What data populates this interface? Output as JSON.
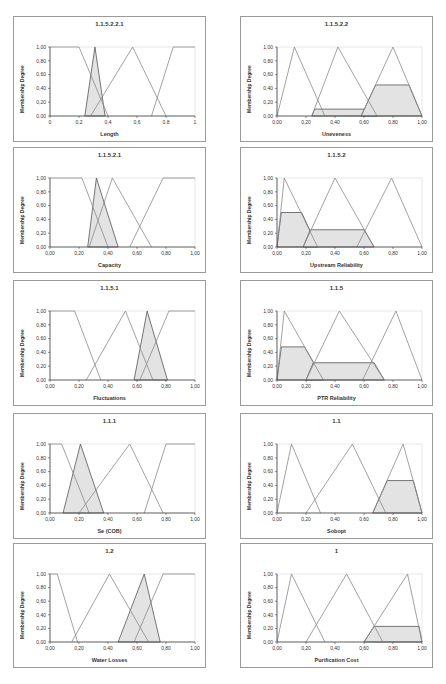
{
  "page": {
    "ylabel": "Membership Degree"
  },
  "chart_data": [
    {
      "type": "line",
      "title": "1.1.5.2.2.1",
      "xlabel": "Length",
      "ylabel": "Membership Degree",
      "xticks": [
        "0",
        "0,2",
        "0,4",
        "0,6",
        "0,8",
        "1"
      ],
      "yticks": [
        "0,00",
        "0,20",
        "0,40",
        "0,60",
        "0,80",
        "1,00"
      ],
      "xlim": [
        0,
        1
      ],
      "ylim": [
        0,
        1
      ],
      "series": [
        {
          "name": "MF1",
          "x": [
            0,
            0.2,
            0.4
          ],
          "y": [
            1,
            1,
            0
          ]
        },
        {
          "name": "MF2",
          "x": [
            0.28,
            0.57,
            0.8
          ],
          "y": [
            0,
            1,
            0
          ]
        },
        {
          "name": "MF3",
          "x": [
            0.7,
            0.85,
            1
          ],
          "y": [
            0,
            1,
            1
          ]
        },
        {
          "name": "Input",
          "x": [
            0.24,
            0.31,
            0.38
          ],
          "y": [
            0,
            1,
            0
          ],
          "shaded": true
        }
      ]
    },
    {
      "type": "line",
      "title": "1.1.5.2.2",
      "xlabel": "Uneveness",
      "ylabel": "Membership Degree",
      "xticks": [
        "0,00",
        "0,20",
        "0,40",
        "0,60",
        "0,80",
        "1,00"
      ],
      "yticks": [
        "0,00",
        "0,20",
        "0,40",
        "0,60",
        "0,80",
        "1,00"
      ],
      "xlim": [
        0,
        1
      ],
      "ylim": [
        0,
        1
      ],
      "series": [
        {
          "name": "MF1",
          "x": [
            0,
            0.12,
            0.33
          ],
          "y": [
            0,
            1,
            0
          ]
        },
        {
          "name": "MF2",
          "x": [
            0.24,
            0.42,
            0.69
          ],
          "y": [
            0,
            1,
            0
          ]
        },
        {
          "name": "MF3",
          "x": [
            0.58,
            0.8,
            1
          ],
          "y": [
            0,
            1,
            0
          ]
        },
        {
          "name": "Clipped1",
          "x": [
            0.24,
            0.26,
            0.66,
            0.69
          ],
          "y": [
            0,
            0.1,
            0.1,
            0
          ],
          "shaded": true
        },
        {
          "name": "Clipped2",
          "x": [
            0.58,
            0.68,
            0.91,
            1
          ],
          "y": [
            0,
            0.45,
            0.45,
            0
          ],
          "shaded": true
        }
      ]
    },
    {
      "type": "line",
      "title": "1.1.5.2.1",
      "xlabel": "Capacity",
      "ylabel": "Membership Degree",
      "xticks": [
        "0,00",
        "0,20",
        "0,40",
        "0,60",
        "0,80",
        "1,00"
      ],
      "yticks": [
        "0,00",
        "0,20",
        "0,40",
        "0,60",
        "0,80",
        "1,00"
      ],
      "xlim": [
        0,
        1
      ],
      "ylim": [
        0,
        1
      ],
      "series": [
        {
          "name": "MF1",
          "x": [
            0,
            0.22,
            0.4
          ],
          "y": [
            1,
            1,
            0
          ]
        },
        {
          "name": "MF2",
          "x": [
            0.27,
            0.43,
            0.7
          ],
          "y": [
            0,
            1,
            0
          ]
        },
        {
          "name": "MF3",
          "x": [
            0.55,
            0.78,
            1
          ],
          "y": [
            0,
            1,
            1
          ]
        },
        {
          "name": "Input",
          "x": [
            0.26,
            0.32,
            0.47
          ],
          "y": [
            0,
            1,
            0
          ],
          "shaded": true
        }
      ]
    },
    {
      "type": "line",
      "title": "1.1.5.2",
      "xlabel": "Upstream Reliability",
      "ylabel": "Membership Degree",
      "xticks": [
        "0,00",
        "0,20",
        "0,40",
        "0,60",
        "0,80",
        "1,00"
      ],
      "yticks": [
        "0,00",
        "0,20",
        "0,40",
        "0,60",
        "0,80",
        "1,00"
      ],
      "xlim": [
        0,
        1
      ],
      "ylim": [
        0,
        1
      ],
      "series": [
        {
          "name": "MF1",
          "x": [
            0,
            0.05,
            0.28
          ],
          "y": [
            0,
            1,
            0
          ]
        },
        {
          "name": "MF2",
          "x": [
            0.18,
            0.4,
            0.67
          ],
          "y": [
            0,
            1,
            0
          ]
        },
        {
          "name": "MF3",
          "x": [
            0.55,
            0.79,
            1
          ],
          "y": [
            0,
            1,
            0
          ]
        },
        {
          "name": "Clipped1",
          "x": [
            0,
            0.03,
            0.17,
            0.28
          ],
          "y": [
            0,
            0.5,
            0.5,
            0
          ],
          "shaded": true
        },
        {
          "name": "Clipped2",
          "x": [
            0.18,
            0.23,
            0.6,
            0.67
          ],
          "y": [
            0,
            0.25,
            0.25,
            0
          ],
          "shaded": true
        }
      ]
    },
    {
      "type": "line",
      "title": "1.1.5.1",
      "xlabel": "Fluctuations",
      "ylabel": "Membership Degree",
      "xticks": [
        "0,00",
        "0,20",
        "0,40",
        "0,60",
        "0,80",
        "1,00"
      ],
      "yticks": [
        "0,00",
        "0,20",
        "0,40",
        "0,60",
        "0,80",
        "1,00"
      ],
      "xlim": [
        0,
        1
      ],
      "ylim": [
        0,
        1
      ],
      "series": [
        {
          "name": "MF1",
          "x": [
            0,
            0.17,
            0.35
          ],
          "y": [
            1,
            1,
            0
          ]
        },
        {
          "name": "MF2",
          "x": [
            0.25,
            0.52,
            0.71
          ],
          "y": [
            0,
            1,
            0
          ]
        },
        {
          "name": "MF3",
          "x": [
            0.62,
            0.82,
            1
          ],
          "y": [
            0,
            1,
            1
          ]
        },
        {
          "name": "Input",
          "x": [
            0.58,
            0.67,
            0.81
          ],
          "y": [
            0,
            1,
            0
          ],
          "shaded": true
        }
      ]
    },
    {
      "type": "line",
      "title": "1.1.5",
      "xlabel": "PTR Reliability",
      "ylabel": "Membership Degree",
      "xticks": [
        "0,00",
        "0,20",
        "0,40",
        "0,60",
        "0,80",
        "1,00"
      ],
      "yticks": [
        "0,00",
        "0,20",
        "0,40",
        "0,60",
        "0,80",
        "1,00"
      ],
      "xlim": [
        0,
        1
      ],
      "ylim": [
        0,
        1
      ],
      "series": [
        {
          "name": "MF1",
          "x": [
            0,
            0.05,
            0.32
          ],
          "y": [
            0,
            1,
            0
          ]
        },
        {
          "name": "MF2",
          "x": [
            0.2,
            0.43,
            0.74
          ],
          "y": [
            0,
            1,
            0
          ]
        },
        {
          "name": "MF3",
          "x": [
            0.59,
            0.82,
            1
          ],
          "y": [
            0,
            1,
            0
          ]
        },
        {
          "name": "Clipped1",
          "x": [
            0,
            0.03,
            0.19,
            0.32
          ],
          "y": [
            0,
            0.48,
            0.48,
            0
          ],
          "shaded": true
        },
        {
          "name": "Clipped2",
          "x": [
            0.2,
            0.25,
            0.67,
            0.74
          ],
          "y": [
            0,
            0.25,
            0.25,
            0
          ],
          "shaded": true
        }
      ]
    },
    {
      "type": "line",
      "title": "1.1.1",
      "xlabel": "Se (COB)",
      "ylabel": "Membership Degree",
      "xticks": [
        "0,00",
        "0,20",
        "0,40",
        "0,60",
        "0,80",
        "1,00"
      ],
      "yticks": [
        "0,00",
        "0,20",
        "0,40",
        "0,60",
        "0,80",
        "1,00"
      ],
      "xlim": [
        0,
        1
      ],
      "ylim": [
        0,
        1
      ],
      "series": [
        {
          "name": "MF1",
          "x": [
            0,
            0.08,
            0.27
          ],
          "y": [
            1,
            1,
            0
          ]
        },
        {
          "name": "MF2",
          "x": [
            0.2,
            0.55,
            0.78
          ],
          "y": [
            0,
            1,
            0
          ]
        },
        {
          "name": "MF3",
          "x": [
            0.65,
            0.8,
            1
          ],
          "y": [
            0,
            1,
            1
          ]
        },
        {
          "name": "Input",
          "x": [
            0.09,
            0.21,
            0.37
          ],
          "y": [
            0,
            1,
            0
          ],
          "shaded": true
        }
      ]
    },
    {
      "type": "line",
      "title": "1.1",
      "xlabel": "Sobopt",
      "ylabel": "Membership Degree",
      "xticks": [
        "0,00",
        "0,20",
        "0,40",
        "0,60",
        "0,80",
        "1,00"
      ],
      "yticks": [
        "0,00",
        "0,20",
        "0,40",
        "0,60",
        "0,80",
        "1,00"
      ],
      "xlim": [
        0,
        1
      ],
      "ylim": [
        0,
        1
      ],
      "series": [
        {
          "name": "MF1",
          "x": [
            0,
            0.1,
            0.3
          ],
          "y": [
            0,
            1,
            0
          ]
        },
        {
          "name": "MF2",
          "x": [
            0.2,
            0.52,
            0.75
          ],
          "y": [
            0,
            1,
            0
          ]
        },
        {
          "name": "MF3",
          "x": [
            0.66,
            0.87,
            1
          ],
          "y": [
            0,
            1,
            0
          ]
        },
        {
          "name": "Clipped",
          "x": [
            0.66,
            0.76,
            0.94,
            1
          ],
          "y": [
            0,
            0.47,
            0.47,
            0
          ],
          "shaded": true
        }
      ]
    },
    {
      "type": "line",
      "title": "1.2",
      "xlabel": "Water Losses",
      "ylabel": "Membership Degree",
      "xticks": [
        "0,00",
        "0,20",
        "0,40",
        "0,60",
        "0,80",
        "1,00"
      ],
      "yticks": [
        "0,00",
        "0,20",
        "0,40",
        "0,60",
        "0,80",
        "1,00"
      ],
      "xlim": [
        0,
        1
      ],
      "ylim": [
        0,
        1
      ],
      "series": [
        {
          "name": "MF1",
          "x": [
            0,
            0.05,
            0.19
          ],
          "y": [
            1,
            1,
            0
          ]
        },
        {
          "name": "MF2",
          "x": [
            0.15,
            0.41,
            0.68
          ],
          "y": [
            0,
            1,
            0
          ]
        },
        {
          "name": "MF3",
          "x": [
            0.58,
            0.78,
            1
          ],
          "y": [
            0,
            1,
            1
          ]
        },
        {
          "name": "Input",
          "x": [
            0.47,
            0.65,
            0.76
          ],
          "y": [
            0,
            1,
            0
          ],
          "shaded": true
        }
      ]
    },
    {
      "type": "line",
      "title": "1",
      "xlabel": "Purification Cost",
      "ylabel": "Membership Degree",
      "xticks": [
        "0,00",
        "0,20",
        "0,40",
        "0,60",
        "0,80",
        "1,00"
      ],
      "yticks": [
        "0,00",
        "0,20",
        "0,40",
        "0,60",
        "0,80",
        "1,00"
      ],
      "xlim": [
        0,
        1
      ],
      "ylim": [
        0,
        1
      ],
      "series": [
        {
          "name": "MF1",
          "x": [
            0,
            0.1,
            0.33
          ],
          "y": [
            0,
            1,
            0
          ]
        },
        {
          "name": "MF2",
          "x": [
            0.2,
            0.48,
            0.73
          ],
          "y": [
            0,
            1,
            0
          ]
        },
        {
          "name": "MF3",
          "x": [
            0.6,
            0.9,
            1
          ],
          "y": [
            0,
            1,
            0
          ]
        },
        {
          "name": "Clipped",
          "x": [
            0.6,
            0.67,
            0.98,
            1
          ],
          "y": [
            0,
            0.23,
            0.23,
            0
          ],
          "shaded": true
        }
      ]
    }
  ],
  "layout": {
    "panels": [
      {
        "x": 13,
        "y": 16,
        "w": 193,
        "h": 126
      },
      {
        "x": 240,
        "y": 16,
        "w": 193,
        "h": 126
      },
      {
        "x": 13,
        "y": 147,
        "w": 193,
        "h": 126
      },
      {
        "x": 240,
        "y": 147,
        "w": 193,
        "h": 126
      },
      {
        "x": 13,
        "y": 280,
        "w": 193,
        "h": 126
      },
      {
        "x": 240,
        "y": 280,
        "w": 193,
        "h": 126
      },
      {
        "x": 13,
        "y": 413,
        "w": 193,
        "h": 126
      },
      {
        "x": 240,
        "y": 413,
        "w": 193,
        "h": 126
      },
      {
        "x": 13,
        "y": 543,
        "w": 193,
        "h": 125
      },
      {
        "x": 240,
        "y": 543,
        "w": 193,
        "h": 125
      }
    ]
  }
}
